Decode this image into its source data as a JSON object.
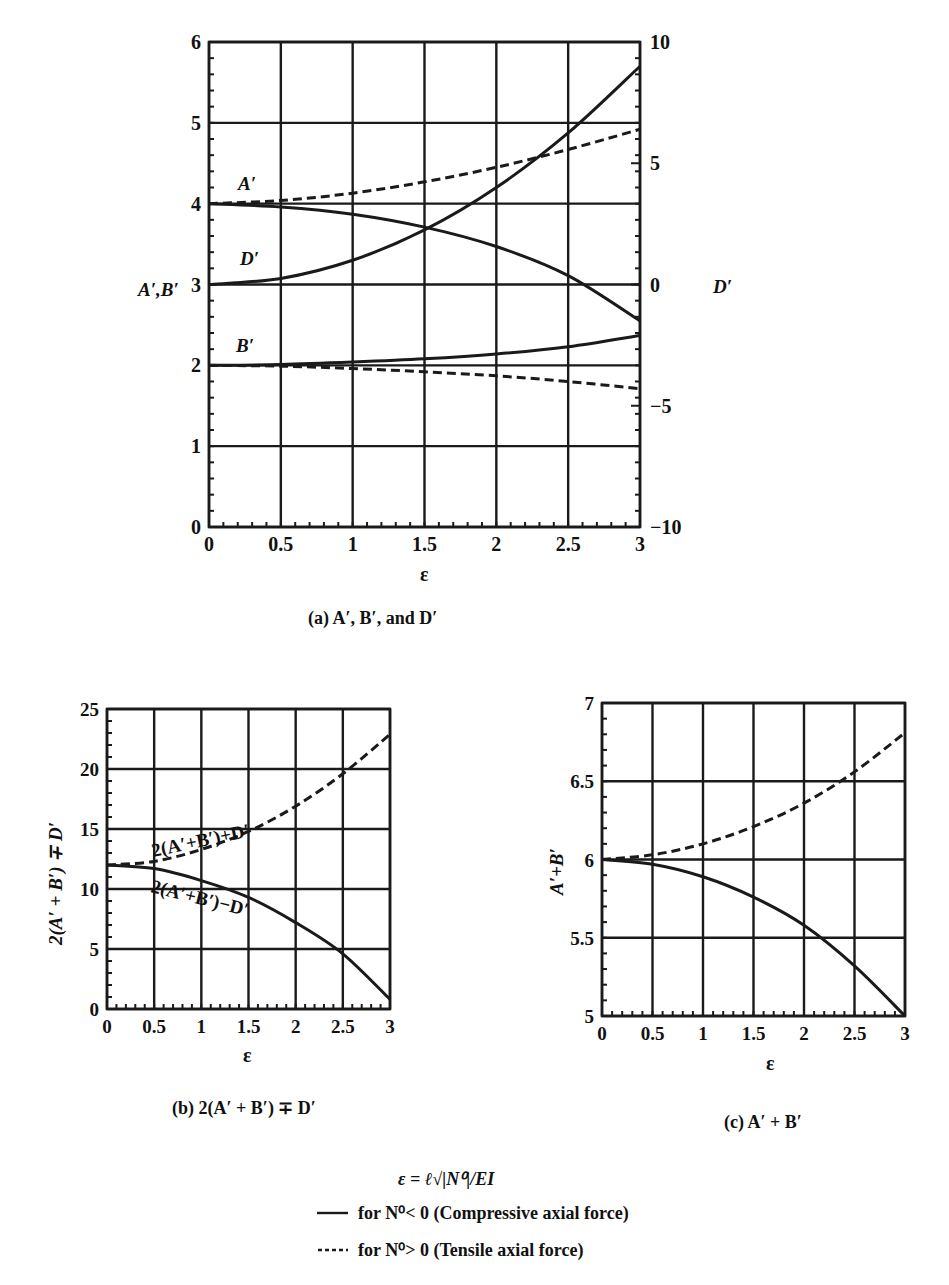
{
  "chart_data": [
    {
      "id": "a",
      "type": "line",
      "caption": "(a) A′, B′, and D′",
      "xlabel": "ε",
      "ylabel": "A′,B′",
      "ylabel_right": "D′",
      "xlim": [
        0,
        3
      ],
      "ylim": [
        0,
        6
      ],
      "ylim_right": [
        -10,
        10
      ],
      "xticks": [
        "0",
        "0.5",
        "1",
        "1.5",
        "2",
        "2.5",
        "3"
      ],
      "yticks": [
        "0",
        "1",
        "2",
        "3",
        "4",
        "5",
        "6"
      ],
      "yticks_right": [
        "−10",
        "−5",
        "0",
        "5",
        "10"
      ],
      "grid": true,
      "x": [
        0,
        0.5,
        1,
        1.5,
        2,
        2.5,
        3
      ],
      "series": [
        {
          "name": "A′ (compressive)",
          "style": "solid",
          "axis": "left",
          "values": [
            4.0,
            3.96,
            3.87,
            3.71,
            3.47,
            3.11,
            2.55
          ]
        },
        {
          "name": "A′ (tensile)",
          "style": "dashed",
          "axis": "left",
          "values": [
            4.0,
            4.04,
            4.13,
            4.27,
            4.45,
            4.67,
            4.92
          ]
        },
        {
          "name": "B′ (compressive)",
          "style": "solid",
          "axis": "left",
          "values": [
            2.0,
            2.01,
            2.04,
            2.08,
            2.14,
            2.23,
            2.37
          ]
        },
        {
          "name": "B′ (tensile)",
          "style": "dashed",
          "axis": "left",
          "values": [
            2.0,
            1.99,
            1.96,
            1.92,
            1.87,
            1.8,
            1.71
          ]
        },
        {
          "name": "D′",
          "style": "solid",
          "axis": "right",
          "values": [
            0.0,
            0.25,
            1.0,
            2.25,
            4.0,
            6.25,
            9.0
          ]
        }
      ],
      "annotations": [
        "A′",
        "D′",
        "B′"
      ]
    },
    {
      "id": "b",
      "type": "line",
      "caption": "(b) 2(A′ + B′) ∓ D′",
      "xlabel": "ε",
      "ylabel": "2(A′ + B′) ∓ D′",
      "xlim": [
        0,
        3
      ],
      "ylim": [
        0,
        25
      ],
      "xticks": [
        "0",
        "0.5",
        "1",
        "1.5",
        "2",
        "2.5",
        "3"
      ],
      "yticks": [
        "0",
        "5",
        "10",
        "15",
        "20",
        "25"
      ],
      "grid": true,
      "x": [
        0,
        0.5,
        1,
        1.5,
        2,
        2.5,
        3
      ],
      "series": [
        {
          "name": "2(A′+B′)+D′",
          "style": "dashed",
          "values": [
            12.0,
            12.3,
            13.3,
            14.8,
            16.9,
            19.6,
            22.9
          ]
        },
        {
          "name": "2(A′+B′)−D′",
          "style": "solid",
          "values": [
            12.0,
            11.7,
            10.7,
            9.3,
            7.2,
            4.6,
            0.8
          ]
        }
      ],
      "annotations": [
        "2(A′+B′)+D′",
        "2(A′+B′)−D′"
      ]
    },
    {
      "id": "c",
      "type": "line",
      "caption": "(c) A′ + B′",
      "xlabel": "ε",
      "ylabel": "A′+B′",
      "xlim": [
        0,
        3
      ],
      "ylim": [
        5,
        7
      ],
      "xticks": [
        "0",
        "0.5",
        "1",
        "1.5",
        "2",
        "2.5",
        "3"
      ],
      "yticks": [
        "5",
        "5.5",
        "6",
        "6.5",
        "7"
      ],
      "grid": true,
      "x": [
        0,
        0.5,
        1,
        1.5,
        2,
        2.5,
        3
      ],
      "series": [
        {
          "name": "A′+B′ (tensile)",
          "style": "dashed",
          "values": [
            6.0,
            6.03,
            6.1,
            6.21,
            6.36,
            6.56,
            6.81
          ]
        },
        {
          "name": "A′+B′ (compressive)",
          "style": "solid",
          "values": [
            6.0,
            5.97,
            5.89,
            5.76,
            5.58,
            5.32,
            5.0
          ]
        }
      ]
    }
  ],
  "legend": {
    "definition": "ε = ℓ√|N⁰|/EI",
    "items": [
      {
        "style": "solid",
        "label": "for N⁰< 0 (Compressive axial force)"
      },
      {
        "style": "dashed",
        "label": "for N⁰> 0 (Tensile axial force)"
      }
    ]
  },
  "text": {
    "a_ylabel": "A′,B′",
    "a_ylabel_right": "D′",
    "a_label_A": "A′",
    "a_label_D": "D′",
    "a_label_B": "B′",
    "eps": "ε",
    "b_ylabel": "2(A′ + B′) ∓ D′",
    "b_label_plus": "2(A′+B′)+D′",
    "b_label_minus": "2(A′+B′)−D′",
    "c_ylabel": "A′+B′",
    "cap_a": "(a) A′, B′, and D′",
    "cap_b": "(b) 2(A′ + B′) ∓ D′",
    "cap_c": "(c) A′ + B′",
    "legend_def": "ε = ℓ√|N⁰|/EI",
    "legend_solid": "for N⁰< 0 (Compressive axial force)",
    "legend_dashed": "for N⁰> 0 (Tensile axial force)"
  }
}
